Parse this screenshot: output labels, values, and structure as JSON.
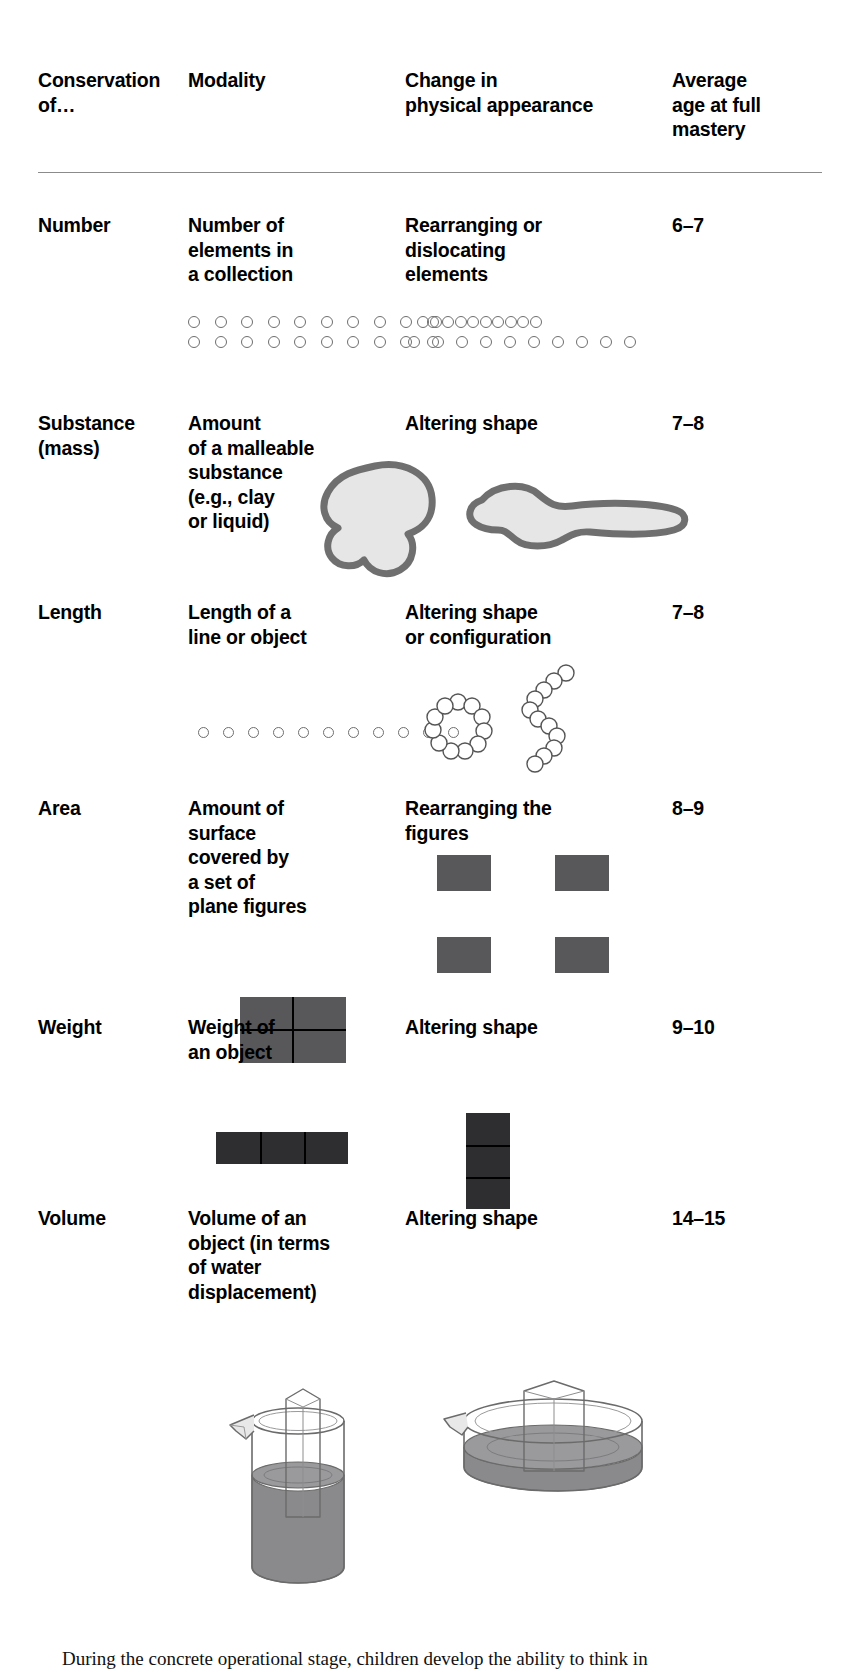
{
  "table": {
    "headers": [
      "Conservation of…",
      "Modality",
      "Change in physical appearance",
      "Average age at full mastery"
    ],
    "header_lines": {
      "h1_l1": "Conservation",
      "h1_l2": "of…",
      "h2_l1": "Modality",
      "h3_l1": "Change in",
      "h3_l2": "physical appearance",
      "h4_l1": "Average",
      "h4_l2": "age at full",
      "h4_l3": "mastery"
    },
    "rows": [
      {
        "conservation": "Number",
        "modality": "Number of elements in a collection",
        "modality_lines": [
          "Number of",
          "elements in",
          "a collection"
        ],
        "change": "Rearranging or dislocating elements",
        "change_lines": [
          "Rearranging or",
          "dislocating",
          "elements"
        ],
        "age": "6–7",
        "illustration": {
          "type": "circle-rows",
          "left_top_count": 10,
          "left_bottom_count": 10,
          "right_top_count": 10,
          "right_bottom_count": 10,
          "right_top_spacing": "tight",
          "right_bottom_spacing": "wide"
        }
      },
      {
        "conservation": "Substance (mass)",
        "conservation_lines": [
          "Substance",
          "(mass)"
        ],
        "modality": "Amount of a malleable substance (e.g., clay or liquid)",
        "modality_lines": [
          "Amount",
          "of a malleable",
          "substance",
          "(e.g., clay",
          "or liquid)"
        ],
        "change": "Altering shape",
        "change_lines": [
          "Altering shape"
        ],
        "age": "7–8",
        "illustration": {
          "type": "clay-blobs",
          "left_shape": "round ball of clay",
          "right_shape": "flattened elongated clay",
          "fill": "#e3e3e3",
          "stroke": "#6b6b6b"
        }
      },
      {
        "conservation": "Length",
        "modality": "Length of a line or object",
        "modality_lines": [
          "Length of a",
          "line or object"
        ],
        "change": "Altering shape or configuration",
        "change_lines": [
          "Altering shape",
          "or configuration"
        ],
        "age": "7–8",
        "illustration": {
          "type": "circle-chain",
          "left_count": 11,
          "left_shape": "straight line",
          "right_shapes": [
            "ring",
            "zigzag"
          ],
          "ring_count": 11,
          "zigzag_count": 11
        }
      },
      {
        "conservation": "Area",
        "modality": "Amount of surface covered by a set of plane figures",
        "modality_lines": [
          "Amount of",
          "surface",
          "covered by",
          "a set of",
          "plane figures"
        ],
        "change": "Rearranging the figures",
        "change_lines": [
          "Rearranging the",
          "figures"
        ],
        "age": "8–9",
        "illustration": {
          "type": "squares",
          "left_arrangement": "2x2 contiguous block",
          "right_arrangement": "4 separated rectangles",
          "count": 4,
          "fill": "#58585a"
        }
      },
      {
        "conservation": "Weight",
        "modality": "Weight of an object",
        "modality_lines": [
          "Weight of",
          "an object"
        ],
        "change": "Altering shape",
        "change_lines": [
          "Altering shape"
        ],
        "age": "9–10",
        "illustration": {
          "type": "blocks",
          "left_arrangement": "3 blocks in a horizontal row",
          "right_arrangement": "3 blocks stacked vertically",
          "count": 3,
          "fill": "#2e2e30"
        }
      },
      {
        "conservation": "Volume",
        "modality": "Volume of an object (in terms of water displacement)",
        "modality_lines": [
          "Volume of an",
          "object (in terms",
          "of water",
          "displacement)"
        ],
        "change": "Altering shape",
        "change_lines": [
          "Altering shape"
        ],
        "age": "14–15",
        "illustration": {
          "type": "water-vessels",
          "left_shape": "tall narrow beaker with spout, water and submerged block",
          "right_shape": "wide shallow dish with water and submerged block",
          "water_fill": "#8a8a8c",
          "glass_stroke": "#6b6b6b"
        }
      }
    ]
  },
  "caption": {
    "text": "During the concrete operational stage, children develop the ability to think in"
  }
}
